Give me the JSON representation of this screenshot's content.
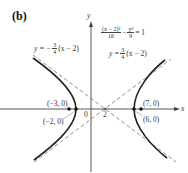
{
  "panel_label": "(b)",
  "axes": {
    "x_label": "x",
    "y_label": "y",
    "origin_label": "0",
    "center_tick_label": "2"
  },
  "equation": {
    "lhs_num1": "(x − 2)²",
    "lhs_den1": "16",
    "minus": "−",
    "lhs_num2": "y²",
    "lhs_den2": "9",
    "rhs": "= 1"
  },
  "asymptote_pos": {
    "prefix": "y =",
    "num": "3",
    "den": "4",
    "suffix": "(x − 2)"
  },
  "asymptote_neg": {
    "prefix": "y = −",
    "num": "3",
    "den": "4",
    "suffix": "(x − 2)"
  },
  "points": {
    "left_focus": "(−3, 0)",
    "left_vertex": "(−2, 0)",
    "right_focus": "(7, 0)",
    "right_vertex": "(6, 0)"
  },
  "colors": {
    "curve": "#222222",
    "axes": "#444444",
    "asymptote": "#777777"
  }
}
